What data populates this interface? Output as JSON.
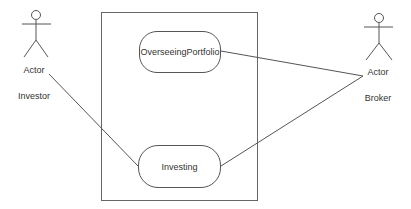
{
  "diagram": {
    "type": "use-case",
    "system_boundary": {
      "x": 101,
      "y": 12,
      "width": 156,
      "height": 188,
      "label": ""
    },
    "actors": [
      {
        "id": "investor",
        "stereotype_label": "Actor",
        "name": "Investor",
        "head": [
          36,
          15
        ],
        "label_pos": [
          34,
          70
        ],
        "name_pos": [
          34,
          96
        ]
      },
      {
        "id": "broker",
        "stereotype_label": "Actor",
        "name": "Broker",
        "head": [
          379,
          18
        ],
        "label_pos": [
          378,
          72
        ],
        "name_pos": [
          378,
          98
        ]
      }
    ],
    "use_cases": [
      {
        "id": "overseeing",
        "label": "OverseeingPortfolio",
        "x": 139,
        "y": 31,
        "width": 82,
        "height": 42
      },
      {
        "id": "investing",
        "label": "Investing",
        "x": 138,
        "y": 145,
        "width": 83,
        "height": 43
      }
    ],
    "associations": [
      {
        "from": "investor",
        "to": "investing",
        "points": [
          [
            49,
            74
          ],
          [
            138,
            166
          ]
        ]
      },
      {
        "from": "overseeing",
        "to": "broker",
        "points": [
          [
            221,
            51
          ],
          [
            363,
            76
          ]
        ]
      },
      {
        "from": "investing",
        "to": "broker",
        "points": [
          [
            221,
            166
          ],
          [
            363,
            76
          ]
        ]
      }
    ],
    "colors": {
      "stroke": "#555555",
      "text": "#333333",
      "background": "#ffffff"
    }
  }
}
